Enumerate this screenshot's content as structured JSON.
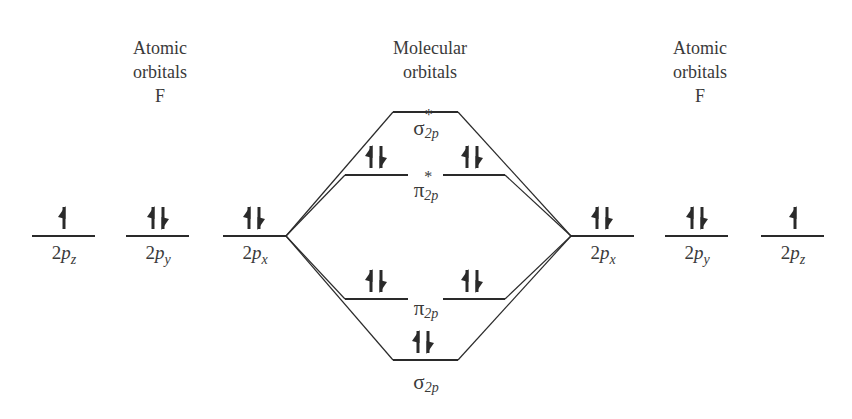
{
  "headers": {
    "left": {
      "line1": "Atomic",
      "line2": "orbitals",
      "line3": "F"
    },
    "middle": {
      "line1": "Molecular",
      "line2": "orbitals"
    },
    "right": {
      "line1": "Atomic",
      "line2": "orbitals",
      "line3": "F"
    }
  },
  "atomic_left": [
    {
      "base": "2",
      "p": "p",
      "sub": "z",
      "electrons": "up"
    },
    {
      "base": "2",
      "p": "p",
      "sub": "y",
      "electrons": "paired"
    },
    {
      "base": "2",
      "p": "p",
      "sub": "x",
      "electrons": "paired"
    }
  ],
  "atomic_right": [
    {
      "base": "2",
      "p": "p",
      "sub": "x",
      "electrons": "paired"
    },
    {
      "base": "2",
      "p": "p",
      "sub": "y",
      "electrons": "paired"
    },
    {
      "base": "2",
      "p": "p",
      "sub": "z",
      "electrons": "up"
    }
  ],
  "molecular": {
    "sigma_star": {
      "symbol": "σ",
      "sup": "*",
      "sub": "2p",
      "electrons": "none"
    },
    "pi_star": {
      "symbol": "π",
      "sup": "*",
      "sub": "2p",
      "electrons": [
        "paired",
        "paired"
      ]
    },
    "pi": {
      "symbol": "π",
      "sub": "2p",
      "electrons": [
        "paired",
        "paired"
      ]
    },
    "sigma": {
      "symbol": "σ",
      "sub": "2p",
      "electrons": "paired"
    }
  },
  "colors": {
    "line": "#2a2a2a",
    "text": "#3a3a3a",
    "background": "#ffffff"
  }
}
